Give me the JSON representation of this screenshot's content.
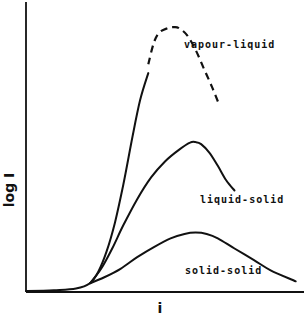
{
  "chart_data": {
    "type": "line",
    "title": "",
    "xlabel": "i",
    "ylabel": "log I",
    "xlim": [
      0,
      100
    ],
    "ylim": [
      0,
      100
    ],
    "grid": false,
    "ticks": "none",
    "series": [
      {
        "name": "vapour-liquid",
        "label": "vapour-liquid",
        "solid_points": [
          [
            0,
            0.3
          ],
          [
            10,
            0.6
          ],
          [
            18,
            1.2
          ],
          [
            23,
            3
          ],
          [
            26,
            7
          ],
          [
            29,
            14
          ],
          [
            32,
            24
          ],
          [
            35,
            37
          ],
          [
            38,
            52
          ],
          [
            41,
            66
          ],
          [
            44,
            75.5
          ]
        ],
        "dashed_points": [
          [
            44,
            78.5
          ],
          [
            46,
            86
          ],
          [
            48,
            89.5
          ],
          [
            51,
            91
          ],
          [
            53,
            91.3
          ],
          [
            55,
            91
          ],
          [
            58,
            88.5
          ],
          [
            61,
            83.5
          ],
          [
            64,
            77
          ],
          [
            67,
            70.5
          ],
          [
            69.5,
            64.5
          ]
        ]
      },
      {
        "name": "liquid-solid",
        "label": "liquid-solid",
        "solid_points": [
          [
            23,
            3
          ],
          [
            27,
            8
          ],
          [
            31,
            15
          ],
          [
            35,
            23
          ],
          [
            40,
            32
          ],
          [
            45,
            39.5
          ],
          [
            50,
            45
          ],
          [
            55,
            49
          ],
          [
            59,
            51.5
          ],
          [
            61,
            51.7
          ],
          [
            63,
            51
          ],
          [
            66,
            48
          ],
          [
            69,
            43.5
          ],
          [
            72,
            38.5
          ],
          [
            75,
            35
          ]
        ],
        "dashed_points": []
      },
      {
        "name": "solid-solid",
        "label": "solid-solid",
        "solid_points": [
          [
            23,
            3
          ],
          [
            28,
            5
          ],
          [
            34,
            8
          ],
          [
            40,
            12
          ],
          [
            46,
            15.5
          ],
          [
            52,
            18.5
          ],
          [
            57,
            20
          ],
          [
            61,
            20.5
          ],
          [
            65,
            20
          ],
          [
            69,
            18.5
          ],
          [
            75,
            15
          ],
          [
            82,
            11
          ],
          [
            88,
            7.5
          ],
          [
            97,
            3.7
          ]
        ],
        "dashed_points": []
      }
    ],
    "annotations": [
      {
        "text": "vapour-liquid",
        "series": "vapour-liquid"
      },
      {
        "text": "liquid-solid",
        "series": "liquid-solid"
      },
      {
        "text": "solid-solid",
        "series": "solid-solid"
      }
    ]
  }
}
